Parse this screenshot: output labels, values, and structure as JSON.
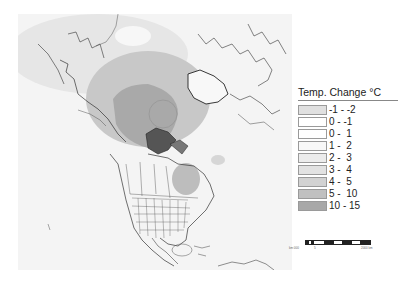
{
  "map": {
    "subject": "Temperature change, North America and Arctic",
    "background_color": "#f4f4f4",
    "line_color": "#333333",
    "regions": [
      {
        "name": "arctic-ocean-warming-core",
        "class": "10 - 15",
        "color": "#a9a9a9"
      },
      {
        "name": "arctic-warming-halo",
        "class": "5 - 10",
        "color": "#c2c2c2"
      },
      {
        "name": "hudson-bay-warming",
        "class": "5 - 10",
        "color": "#bdbdbd"
      },
      {
        "name": "north-atlantic-cooling",
        "class": "-1 - -2",
        "color": "#dcdcdc"
      }
    ]
  },
  "legend": {
    "title": "Temp. Change °C",
    "items": [
      {
        "label": "-1 - -2",
        "color": "#e0e0e0"
      },
      {
        "label": "0 - -1",
        "color": "#ffffff"
      },
      {
        "label": "0 -  1",
        "color": "#ffffff"
      },
      {
        "label": "1 -  2",
        "color": "#f8f8f8"
      },
      {
        "label": "2 -  3",
        "color": "#ececec"
      },
      {
        "label": "3 -  4",
        "color": "#e2e2e2"
      },
      {
        "label": "4 -  5",
        "color": "#d2d2d2"
      },
      {
        "label": "5 -  10",
        "color": "#c0c0c0"
      },
      {
        "label": "10 - 15",
        "color": "#a8a8a8"
      }
    ]
  },
  "scalebar": {
    "left_label": "km 000",
    "mid_label": "5",
    "right_label": "2000 km"
  }
}
